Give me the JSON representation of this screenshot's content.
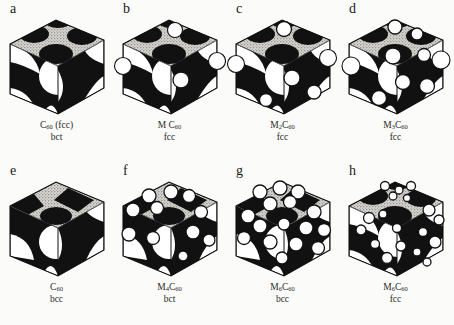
{
  "figure": {
    "background_color": "#fbfbf9",
    "ink_color": "#111111",
    "stipple_color": "#d8d6d0",
    "sphere_fill": "#ffffff",
    "panels": [
      {
        "letter": "a",
        "formula_main": "C",
        "formula_sub": "60",
        "formula_suffix": " (fcc)",
        "lattice": "bct",
        "structure": "bct",
        "dopant_count": 0,
        "dopants": []
      },
      {
        "letter": "b",
        "formula_main": "M C",
        "formula_sub": "60",
        "formula_suffix": "",
        "lattice": "fcc",
        "structure": "fcc",
        "dopant_count": 4,
        "dopants": [
          {
            "cx": 62,
            "cy": 16,
            "r": 7.5,
            "style": "outline"
          },
          {
            "cx": 10,
            "cy": 52,
            "r": 8.5,
            "style": "outline"
          },
          {
            "cx": 104,
            "cy": 47,
            "r": 8.5,
            "style": "outline"
          },
          {
            "cx": 68,
            "cy": 66,
            "r": 8.0,
            "style": "solid"
          }
        ]
      },
      {
        "letter": "c",
        "formula_main": "M",
        "formula_sub": "2",
        "formula_suffix": "C",
        "formula_sub2": "60",
        "lattice": "fcc",
        "structure": "fcc",
        "dopant_count": 6,
        "dopants": [
          {
            "cx": 58,
            "cy": 15,
            "r": 7.5,
            "style": "solid"
          },
          {
            "cx": 10,
            "cy": 50,
            "r": 8.5,
            "style": "outline"
          },
          {
            "cx": 102,
            "cy": 44,
            "r": 8.5,
            "style": "outline"
          },
          {
            "cx": 66,
            "cy": 64,
            "r": 8.0,
            "style": "solid"
          },
          {
            "cx": 88,
            "cy": 78,
            "r": 7.0,
            "style": "solid"
          },
          {
            "cx": 40,
            "cy": 86,
            "r": 6.5,
            "style": "solid"
          }
        ]
      },
      {
        "letter": "d",
        "formula_main": "M",
        "formula_sub": "3",
        "formula_suffix": "C",
        "formula_sub2": "60",
        "lattice": "fcc",
        "structure": "fcc",
        "dopant_count": 9,
        "dopants": [
          {
            "cx": 56,
            "cy": 13,
            "r": 7.0,
            "style": "solid"
          },
          {
            "cx": 78,
            "cy": 20,
            "r": 6.0,
            "style": "solid"
          },
          {
            "cx": 12,
            "cy": 52,
            "r": 9.0,
            "style": "outline"
          },
          {
            "cx": 102,
            "cy": 46,
            "r": 9.0,
            "style": "outline"
          },
          {
            "cx": 54,
            "cy": 42,
            "r": 8.0,
            "style": "solid"
          },
          {
            "cx": 85,
            "cy": 41,
            "r": 6.5,
            "style": "solid"
          },
          {
            "cx": 64,
            "cy": 68,
            "r": 7.5,
            "style": "solid"
          },
          {
            "cx": 88,
            "cy": 72,
            "r": 7.5,
            "style": "solid"
          },
          {
            "cx": 40,
            "cy": 84,
            "r": 7.5,
            "style": "solid"
          }
        ]
      },
      {
        "letter": "e",
        "formula_main": "C",
        "formula_sub": "60",
        "formula_suffix": "",
        "lattice": "bcc",
        "structure": "bcc",
        "dopant_count": 0,
        "dopants": []
      },
      {
        "letter": "f",
        "formula_main": "M",
        "formula_sub": "4",
        "formula_suffix": "C",
        "formula_sub2": "60",
        "lattice": "bct",
        "structure": "bcc",
        "dopant_count": 11,
        "dopants": [
          {
            "cx": 36,
            "cy": 20,
            "r": 7.0,
            "style": "solid"
          },
          {
            "cx": 58,
            "cy": 16,
            "r": 7.0,
            "style": "solid"
          },
          {
            "cx": 76,
            "cy": 20,
            "r": 6.5,
            "style": "solid"
          },
          {
            "cx": 20,
            "cy": 34,
            "r": 7.0,
            "style": "solid"
          },
          {
            "cx": 44,
            "cy": 32,
            "r": 6.5,
            "style": "solid"
          },
          {
            "cx": 88,
            "cy": 36,
            "r": 6.5,
            "style": "solid"
          },
          {
            "cx": 16,
            "cy": 58,
            "r": 7.0,
            "style": "solid"
          },
          {
            "cx": 40,
            "cy": 62,
            "r": 6.5,
            "style": "solid"
          },
          {
            "cx": 80,
            "cy": 56,
            "r": 7.0,
            "style": "solid"
          },
          {
            "cx": 96,
            "cy": 64,
            "r": 6.0,
            "style": "solid"
          },
          {
            "cx": 70,
            "cy": 80,
            "r": 5.0,
            "style": "solid"
          }
        ]
      },
      {
        "letter": "g",
        "formula_main": "M",
        "formula_sub": "6",
        "formula_suffix": "C",
        "formula_sub2": "60",
        "lattice": "bcc",
        "structure": "bcc",
        "dopant_count": 16,
        "dopants": [
          {
            "cx": 34,
            "cy": 16,
            "r": 7.0,
            "style": "solid"
          },
          {
            "cx": 54,
            "cy": 12,
            "r": 7.0,
            "style": "solid"
          },
          {
            "cx": 72,
            "cy": 16,
            "r": 7.0,
            "style": "solid"
          },
          {
            "cx": 44,
            "cy": 28,
            "r": 7.0,
            "style": "solid"
          },
          {
            "cx": 64,
            "cy": 26,
            "r": 6.5,
            "style": "solid"
          },
          {
            "cx": 22,
            "cy": 40,
            "r": 7.0,
            "style": "solid"
          },
          {
            "cx": 88,
            "cy": 36,
            "r": 7.0,
            "style": "solid"
          },
          {
            "cx": 34,
            "cy": 50,
            "r": 7.0,
            "style": "solid"
          },
          {
            "cx": 58,
            "cy": 48,
            "r": 6.0,
            "style": "solid"
          },
          {
            "cx": 80,
            "cy": 52,
            "r": 7.0,
            "style": "solid"
          },
          {
            "cx": 98,
            "cy": 54,
            "r": 6.5,
            "style": "solid"
          },
          {
            "cx": 18,
            "cy": 62,
            "r": 6.5,
            "style": "solid"
          },
          {
            "cx": 44,
            "cy": 66,
            "r": 7.0,
            "style": "solid"
          },
          {
            "cx": 70,
            "cy": 68,
            "r": 7.0,
            "style": "solid"
          },
          {
            "cx": 92,
            "cy": 72,
            "r": 6.5,
            "style": "solid"
          },
          {
            "cx": 56,
            "cy": 82,
            "r": 6.0,
            "style": "solid"
          }
        ]
      },
      {
        "letter": "h",
        "formula_main": "M",
        "formula_sub": "6",
        "formula_suffix": "C",
        "formula_sub2": "60",
        "lattice": "fcc",
        "structure": "fcc",
        "dopant_count": 18,
        "dopants": [
          {
            "cx": 46,
            "cy": 10,
            "r": 4.5,
            "style": "solid"
          },
          {
            "cx": 60,
            "cy": 14,
            "r": 4.0,
            "style": "solid"
          },
          {
            "cx": 72,
            "cy": 10,
            "r": 4.5,
            "style": "solid"
          },
          {
            "cx": 54,
            "cy": 20,
            "r": 4.0,
            "style": "solid"
          },
          {
            "cx": 68,
            "cy": 22,
            "r": 3.5,
            "style": "solid"
          },
          {
            "cx": 30,
            "cy": 42,
            "r": 5.5,
            "style": "solid"
          },
          {
            "cx": 44,
            "cy": 38,
            "r": 4.0,
            "style": "solid"
          },
          {
            "cx": 90,
            "cy": 34,
            "r": 6.0,
            "style": "solid"
          },
          {
            "cx": 100,
            "cy": 44,
            "r": 5.0,
            "style": "solid"
          },
          {
            "cx": 22,
            "cy": 54,
            "r": 5.0,
            "style": "solid"
          },
          {
            "cx": 58,
            "cy": 52,
            "r": 4.5,
            "style": "solid"
          },
          {
            "cx": 84,
            "cy": 56,
            "r": 4.5,
            "style": "solid"
          },
          {
            "cx": 96,
            "cy": 66,
            "r": 6.0,
            "style": "solid"
          },
          {
            "cx": 36,
            "cy": 68,
            "r": 4.5,
            "style": "solid"
          },
          {
            "cx": 62,
            "cy": 70,
            "r": 5.0,
            "style": "solid"
          },
          {
            "cx": 78,
            "cy": 76,
            "r": 4.0,
            "style": "solid"
          },
          {
            "cx": 48,
            "cy": 82,
            "r": 5.5,
            "style": "solid"
          },
          {
            "cx": 88,
            "cy": 86,
            "r": 4.0,
            "style": "solid"
          }
        ]
      }
    ]
  }
}
